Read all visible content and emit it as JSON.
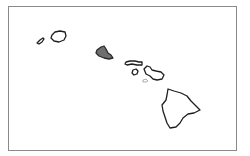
{
  "map": {
    "region": "Hawaiian Islands",
    "colors": {
      "highlight_fill": "#6e6e6e",
      "outline": "#1e1e1e",
      "frame": "#8a8a8a",
      "background": "#ffffff"
    },
    "islands": [
      {
        "id": "niihau",
        "highlighted": false
      },
      {
        "id": "kauai",
        "highlighted": false
      },
      {
        "id": "oahu",
        "highlighted": true
      },
      {
        "id": "molokai",
        "highlighted": false
      },
      {
        "id": "lanai",
        "highlighted": false
      },
      {
        "id": "maui",
        "highlighted": false
      },
      {
        "id": "kahoolawe",
        "highlighted": false
      },
      {
        "id": "hawaii",
        "highlighted": false
      }
    ]
  }
}
